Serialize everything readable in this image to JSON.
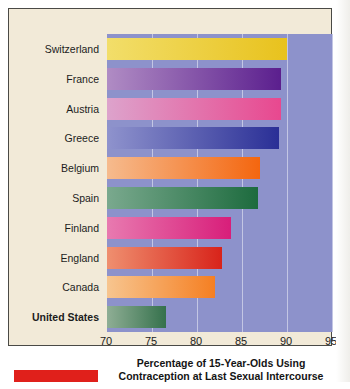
{
  "figure": {
    "background_color": "#f2ead8",
    "plot_background_color": "#8d92cb",
    "accent_tab_color": "#e0201b"
  },
  "chart_data": {
    "type": "bar",
    "orientation": "horizontal",
    "title": "",
    "xlabel": "Percentage of 15-Year-Olds Using Contraception at Last Sexual Intercourse",
    "xlabel_line1": "Percentage of 15-Year-Olds Using",
    "xlabel_line2": "Contraception at Last Sexual Intercourse",
    "ylabel": "",
    "xlim": [
      70,
      95
    ],
    "xticks": [
      70,
      75,
      80,
      85,
      90,
      95
    ],
    "xtick_labels": [
      "70",
      "75",
      "80",
      "85",
      "90",
      "95"
    ],
    "grid": true,
    "legend": "none",
    "categories": [
      "Switzerland",
      "France",
      "Austria",
      "Greece",
      "Belgium",
      "Spain",
      "Finland",
      "England",
      "Canada",
      "United States"
    ],
    "values": [
      90.0,
      89.3,
      89.3,
      89.1,
      87.0,
      86.8,
      83.8,
      82.8,
      82.0,
      76.5
    ],
    "bar_colors": [
      "#f2de6a",
      "#b08cc4",
      "#dda3cc",
      "#8f93cd",
      "#f6bb8e",
      "#7aa98e",
      "#e87ab0",
      "#ef8f6f",
      "#f7c58f",
      "#8fae95"
    ],
    "bar_colors_end": [
      "#e8c21d",
      "#5b1f8e",
      "#e8488f",
      "#2a2f96",
      "#f4660f",
      "#1d6b3e",
      "#d81e7a",
      "#d8231a",
      "#f57f22",
      "#35714c"
    ],
    "highlighted_category": "United States"
  }
}
